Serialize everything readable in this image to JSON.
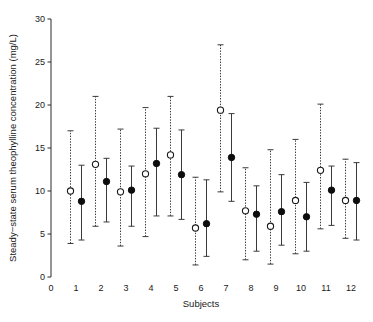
{
  "chart_data": {
    "type": "scatter",
    "title": "",
    "xlabel": "Subjects",
    "ylabel": "Steady−state serum theophylline concentration (mg/L)",
    "xlim": [
      0,
      12.6
    ],
    "ylim": [
      0,
      30
    ],
    "xticks": [
      0,
      1,
      2,
      3,
      4,
      5,
      6,
      7,
      8,
      9,
      10,
      11,
      12
    ],
    "xtick_labels": [
      "0",
      "1",
      "2",
      "3",
      "4",
      "5",
      "6",
      "7",
      "8",
      "9",
      "10",
      "11",
      "12"
    ],
    "yticks": [
      0,
      5,
      10,
      15,
      20,
      25,
      30
    ],
    "ytick_labels": [
      "0",
      "5",
      "10",
      "15",
      "20",
      "25",
      "30"
    ],
    "grid": false,
    "legend": "none",
    "categories": [
      "1",
      "2",
      "3",
      "4",
      "5",
      "6",
      "7",
      "8",
      "9",
      "10",
      "11",
      "12"
    ],
    "series": [
      {
        "name": "open-circle-series",
        "marker": "open circle, dashed error bar",
        "values": [
          10.0,
          13.1,
          9.9,
          12.0,
          14.2,
          5.7,
          19.4,
          7.7,
          5.9,
          8.9,
          12.4,
          8.9
        ],
        "lower": [
          3.9,
          5.9,
          3.6,
          4.7,
          7.1,
          1.4,
          9.9,
          2.0,
          1.5,
          2.7,
          5.6,
          4.5
        ],
        "upper": [
          17.0,
          21.0,
          17.2,
          19.7,
          21.0,
          11.6,
          27.0,
          12.7,
          14.8,
          16.0,
          20.1,
          13.7
        ]
      },
      {
        "name": "filled-circle-series",
        "marker": "filled circle, solid error bar",
        "values": [
          8.8,
          11.1,
          10.1,
          13.2,
          11.9,
          6.2,
          13.9,
          7.3,
          7.6,
          7.0,
          10.1,
          8.9
        ],
        "lower": [
          4.3,
          6.4,
          5.9,
          7.1,
          6.7,
          2.4,
          8.8,
          3.0,
          3.7,
          3.0,
          6.0,
          4.3
        ],
        "upper": [
          13.0,
          13.8,
          12.9,
          17.3,
          17.1,
          11.3,
          19.0,
          10.6,
          11.9,
          11.0,
          12.9,
          13.3
        ]
      }
    ],
    "colors": {
      "open_marker_fill": "#ffffff",
      "open_marker_stroke": "#1a1a1a",
      "filled_marker": "#0d0d0d",
      "error_bar": "#3a3a3a",
      "axis": "#2b2b2b",
      "background": "#ffffff"
    }
  }
}
